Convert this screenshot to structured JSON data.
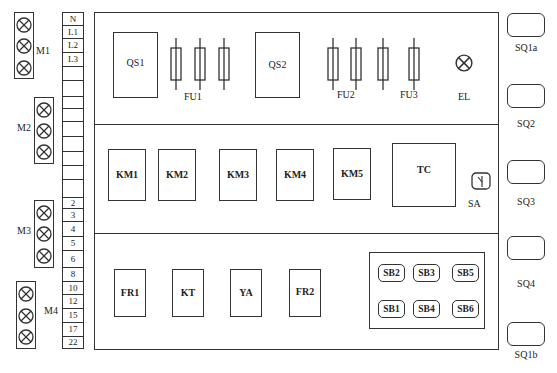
{
  "motors": [
    {
      "label": "M1"
    },
    {
      "label": "M2"
    },
    {
      "label": "M3"
    },
    {
      "label": "M4"
    }
  ],
  "terminal_strip": {
    "rows": [
      {
        "label": "N",
        "top": 12,
        "h": 14
      },
      {
        "label": "L1",
        "top": 26,
        "h": 13
      },
      {
        "label": "L2",
        "top": 39,
        "h": 14
      },
      {
        "label": "L3",
        "top": 53,
        "h": 14
      },
      {
        "label": "",
        "top": 67,
        "h": 14
      },
      {
        "label": "",
        "top": 81,
        "h": 16
      },
      {
        "label": "",
        "top": 97,
        "h": 12
      },
      {
        "label": "",
        "top": 109,
        "h": 13
      },
      {
        "label": "",
        "top": 122,
        "h": 15
      },
      {
        "label": "",
        "top": 137,
        "h": 15
      },
      {
        "label": "",
        "top": 152,
        "h": 14
      },
      {
        "label": "",
        "top": 166,
        "h": 14
      },
      {
        "label": "",
        "top": 180,
        "h": 18
      },
      {
        "label": "2",
        "top": 198,
        "h": 11
      },
      {
        "label": "3",
        "top": 209,
        "h": 13
      },
      {
        "label": "4",
        "top": 222,
        "h": 15
      },
      {
        "label": "5",
        "top": 237,
        "h": 14
      },
      {
        "label": "6",
        "top": 251,
        "h": 17
      },
      {
        "label": "8",
        "top": 268,
        "h": 14
      },
      {
        "label": "10",
        "top": 282,
        "h": 13
      },
      {
        "label": "12",
        "top": 295,
        "h": 14
      },
      {
        "label": "15",
        "top": 309,
        "h": 14
      },
      {
        "label": "17",
        "top": 323,
        "h": 14
      },
      {
        "label": "22",
        "top": 337,
        "h": 12
      }
    ]
  },
  "panel": {
    "top_section": {
      "qs1": "QS1",
      "qs2": "QS2",
      "fu1": "FU1",
      "fu2": "FU2",
      "fu3": "FU3",
      "el": "EL"
    },
    "middle_section": {
      "contactors": [
        "KM1",
        "KM2",
        "KM3",
        "KM4",
        "KM5"
      ],
      "tc": "TC",
      "sa": "SA"
    },
    "bottom_section": {
      "relays": [
        "FR1",
        "KT",
        "YA",
        "FR2"
      ],
      "buttons": [
        "SB2",
        "SB3",
        "SB5",
        "SB1",
        "SB4",
        "SB6"
      ]
    }
  },
  "limit_switches": [
    {
      "label": "SQ1a"
    },
    {
      "label": "SQ2"
    },
    {
      "label": "SQ3"
    },
    {
      "label": "SQ4"
    },
    {
      "label": "SQ1b"
    }
  ],
  "colors": {
    "line": "#333333",
    "background": "#ffffff"
  }
}
